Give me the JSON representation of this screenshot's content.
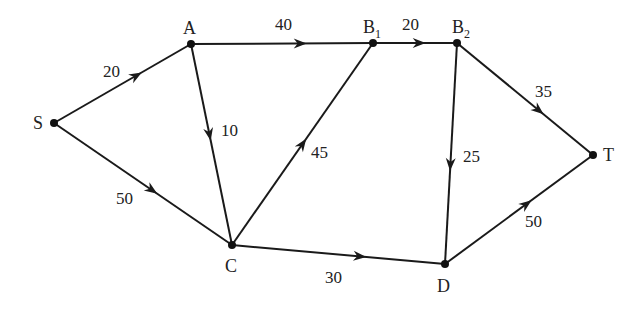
{
  "diagram": {
    "type": "directed-flow-network",
    "nodes": [
      {
        "id": "S",
        "label": "S",
        "sub": "",
        "x": 54,
        "y": 123,
        "lx": 33,
        "ly": 129
      },
      {
        "id": "A",
        "label": "A",
        "sub": "",
        "x": 191,
        "y": 44,
        "lx": 183,
        "ly": 34
      },
      {
        "id": "B1",
        "label": "B",
        "sub": "1",
        "x": 373,
        "y": 43,
        "lx": 363,
        "ly": 33
      },
      {
        "id": "B2",
        "label": "B",
        "sub": "2",
        "x": 457,
        "y": 43,
        "lx": 452,
        "ly": 33
      },
      {
        "id": "C",
        "label": "C",
        "sub": "",
        "x": 232,
        "y": 245,
        "lx": 225,
        "ly": 272
      },
      {
        "id": "D",
        "label": "D",
        "sub": "",
        "x": 445,
        "y": 264,
        "lx": 437,
        "ly": 292
      },
      {
        "id": "T",
        "label": "T",
        "sub": "",
        "x": 593,
        "y": 155,
        "lx": 603,
        "ly": 161
      }
    ],
    "edges": [
      {
        "from": "S",
        "to": "A",
        "weight": "20",
        "t": 0.6,
        "lx": 103,
        "ly": 77
      },
      {
        "from": "S",
        "to": "C",
        "weight": "50",
        "t": 0.55,
        "lx": 116,
        "ly": 204
      },
      {
        "from": "A",
        "to": "B1",
        "weight": "40",
        "t": 0.6,
        "lx": 275,
        "ly": 30
      },
      {
        "from": "A",
        "to": "C",
        "weight": "10",
        "t": 0.45,
        "lx": 221,
        "ly": 136
      },
      {
        "from": "C",
        "to": "B1",
        "weight": "45",
        "t": 0.5,
        "lx": 311,
        "ly": 158
      },
      {
        "from": "B1",
        "to": "B2",
        "weight": "20",
        "t": 0.55,
        "lx": 402,
        "ly": 30
      },
      {
        "from": "B2",
        "to": "D",
        "weight": "25",
        "t": 0.55,
        "lx": 463,
        "ly": 162
      },
      {
        "from": "B2",
        "to": "T",
        "weight": "35",
        "t": 0.6,
        "lx": 535,
        "ly": 97
      },
      {
        "from": "C",
        "to": "D",
        "weight": "30",
        "t": 0.6,
        "lx": 325,
        "ly": 283
      },
      {
        "from": "D",
        "to": "T",
        "weight": "50",
        "t": 0.55,
        "lx": 525,
        "ly": 227
      }
    ]
  }
}
